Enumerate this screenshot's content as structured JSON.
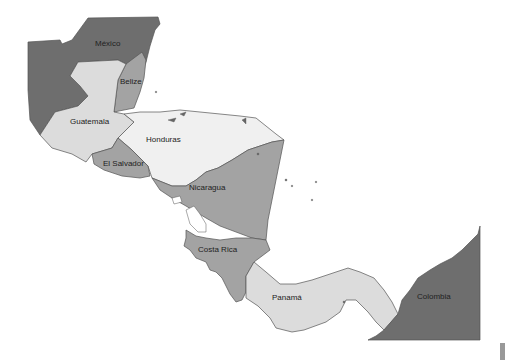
{
  "map": {
    "title": "Central America",
    "colors": {
      "dark": "#6e6e6e",
      "medium": "#a3a3a3",
      "light": "#dcdcdc",
      "lightest": "#f0f0f0",
      "water": "#ffffff",
      "border": "#555555"
    },
    "countries": [
      {
        "name": "México",
        "shade": "dark"
      },
      {
        "name": "Belize",
        "label": "Belize",
        "shade": "medium"
      },
      {
        "name": "Guatemala",
        "shade": "light"
      },
      {
        "name": "Honduras",
        "shade": "lightest"
      },
      {
        "name": "El Salvador",
        "shade": "medium"
      },
      {
        "name": "Nicaragua",
        "shade": "medium"
      },
      {
        "name": "Costa Rica",
        "shade": "medium"
      },
      {
        "name": "Panamá",
        "shade": "light"
      },
      {
        "name": "Colombia",
        "shade": "dark"
      }
    ],
    "labels": {
      "mexico": "México",
      "belize": "Belize",
      "guatemala": "Guatemala",
      "honduras": "Honduras",
      "el_salvador": "El Salvador",
      "nicaragua": "Nicaragua",
      "costa_rica": "Costa Rica",
      "panama": "Panamá",
      "colombia": "Colombia"
    }
  }
}
